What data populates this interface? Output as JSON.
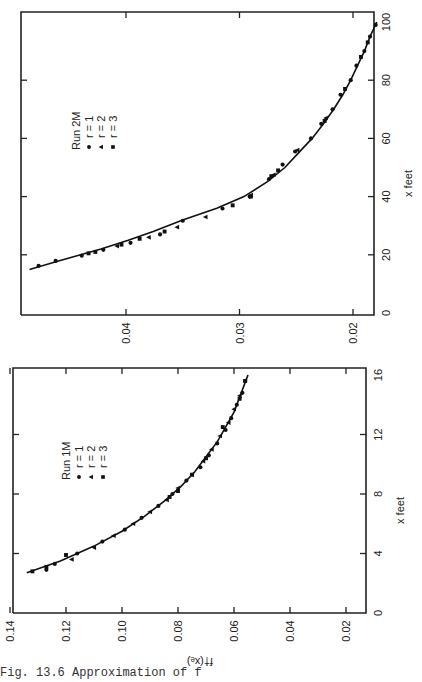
{
  "figure": {
    "caption": "Fig. 13.6  Approximation of f",
    "orientation": "rotated 90° counter-clockwise on page",
    "shared_ylabel": "f†(xₑ)",
    "marker_color": "#111111",
    "axis_color": "#222222"
  },
  "chart_data": [
    {
      "type": "scatter",
      "title": "Run 1M",
      "xlabel": "x  feet",
      "ylabel": "f†(xₑ)",
      "xlim": [
        0,
        16
      ],
      "ylim": [
        0.014,
        0.14
      ],
      "xticks": [
        0,
        4,
        8,
        12,
        16
      ],
      "xtick_labels": [
        "0",
        "4",
        "8",
        "12",
        "16"
      ],
      "yticks": [
        0.02,
        0.04,
        0.06,
        0.08,
        0.1,
        0.12,
        0.14
      ],
      "ytick_labels": [
        "0.02",
        "0.04",
        "0.06",
        "0.08",
        "0.10",
        "0.12",
        "0.14"
      ],
      "grid": false,
      "legend": {
        "title": "Run 1M",
        "entries": [
          {
            "label": "r = 1",
            "marker": "circle"
          },
          {
            "label": "r = 2",
            "marker": "triangle"
          },
          {
            "label": "r = 3",
            "marker": "square"
          }
        ],
        "position": "upper-left (in rotated frame)"
      },
      "curve": {
        "name": "fitted curve",
        "x": [
          2.7,
          3.5,
          4.5,
          5.5,
          6.5,
          7.5,
          8.5,
          9.5,
          10.5,
          11.5,
          12.5,
          13.5,
          14.5,
          15.5,
          16.0
        ],
        "y": [
          0.134,
          0.122,
          0.11,
          0.1,
          0.092,
          0.085,
          0.079,
          0.074,
          0.07,
          0.066,
          0.063,
          0.06,
          0.058,
          0.056,
          0.055
        ]
      },
      "series": [
        {
          "name": "r = 1",
          "marker": "circle",
          "x": [
            2.9,
            3.3,
            4.0,
            4.8,
            5.6,
            6.4,
            7.2,
            8.0,
            8.9,
            9.8,
            10.6,
            11.4,
            12.3,
            13.1,
            14.0,
            14.8,
            15.6
          ],
          "y": [
            0.127,
            0.124,
            0.116,
            0.107,
            0.099,
            0.093,
            0.087,
            0.082,
            0.077,
            0.072,
            0.069,
            0.066,
            0.063,
            0.061,
            0.059,
            0.057,
            0.056
          ]
        },
        {
          "name": "r = 2",
          "marker": "triangle",
          "x": [
            3.6,
            4.4,
            5.2,
            6.0,
            6.8,
            7.6,
            8.4,
            9.3,
            10.2,
            11.0,
            11.9,
            12.8,
            13.7,
            14.6
          ],
          "y": [
            0.118,
            0.11,
            0.103,
            0.096,
            0.09,
            0.084,
            0.08,
            0.075,
            0.071,
            0.068,
            0.065,
            0.062,
            0.06,
            0.058
          ]
        },
        {
          "name": "r = 3",
          "marker": "square",
          "x": [
            2.8,
            3.1,
            3.9,
            7.8,
            8.2,
            9.3,
            10.4,
            12.5,
            14.4,
            15.6
          ],
          "y": [
            0.132,
            0.127,
            0.12,
            0.083,
            0.08,
            0.075,
            0.07,
            0.064,
            0.058,
            0.056
          ]
        }
      ]
    },
    {
      "type": "scatter",
      "title": "Run 2M",
      "xlabel": "x  feet",
      "ylabel": "",
      "xlim": [
        0,
        100
      ],
      "ylim": [
        0.018,
        0.0493
      ],
      "xticks": [
        0,
        20,
        40,
        60,
        80,
        100
      ],
      "xtick_labels": [
        "0",
        "20",
        "40",
        "60",
        "80",
        "100"
      ],
      "yticks": [
        0.02,
        0.03,
        0.04
      ],
      "ytick_labels": [
        "0.02",
        "0.03",
        "0.04"
      ],
      "grid": false,
      "legend": {
        "title": "Run 2M",
        "entries": [
          {
            "label": "r = 1",
            "marker": "circle"
          },
          {
            "label": "r = 2",
            "marker": "triangle"
          },
          {
            "label": "r = 3",
            "marker": "square"
          }
        ],
        "position": "upper-left (in rotated frame)"
      },
      "curve": {
        "name": "fitted curve",
        "x": [
          15,
          18,
          20,
          22,
          25,
          28,
          32,
          36,
          40,
          45,
          50,
          55,
          60,
          65,
          70,
          75,
          80,
          85,
          90,
          95,
          100
        ],
        "y": [
          0.0485,
          0.0458,
          0.044,
          0.0422,
          0.0398,
          0.0376,
          0.035,
          0.032,
          0.0296,
          0.0276,
          0.026,
          0.0248,
          0.0236,
          0.0226,
          0.0217,
          0.0209,
          0.0202,
          0.0196,
          0.019,
          0.0185,
          0.0179
        ]
      },
      "series": [
        {
          "name": "r = 1",
          "marker": "circle",
          "x": [
            16.2,
            17.9,
            19.7,
            21.7,
            24.1,
            27.0,
            31.7,
            35.9,
            40.0,
            46.0,
            51.0,
            55.5,
            60.0,
            65.0,
            70.0,
            75.0,
            80.0,
            85.0,
            90.0,
            95.0,
            99.0
          ],
          "y": [
            0.0477,
            0.0462,
            0.0439,
            0.042,
            0.0396,
            0.037,
            0.035,
            0.0315,
            0.0291,
            0.0274,
            0.0262,
            0.0251,
            0.0237,
            0.0228,
            0.0218,
            0.0211,
            0.0202,
            0.0197,
            0.019,
            0.0185,
            0.018
          ]
        },
        {
          "name": "r = 2",
          "marker": "triangle",
          "x": [
            23.0,
            26.0,
            29.5,
            33.0,
            40.5,
            47.5,
            56.0,
            67.0
          ],
          "y": [
            0.0408,
            0.038,
            0.0355,
            0.033,
            0.029,
            0.027,
            0.0249,
            0.0224
          ]
        },
        {
          "name": "r = 3",
          "marker": "square",
          "x": [
            20.5,
            21.0,
            23.5,
            25.5,
            28.0,
            37.0,
            40.0,
            47.0,
            49.0,
            66.0,
            77.0,
            88.0,
            93.0
          ],
          "y": [
            0.0433,
            0.0427,
            0.0404,
            0.0388,
            0.0366,
            0.0306,
            0.029,
            0.0272,
            0.0266,
            0.0225,
            0.0207,
            0.0193,
            0.0187
          ]
        }
      ]
    }
  ],
  "layout_panels": [
    {
      "chart_index": 1,
      "name": "panel-run-2m",
      "corner_origin": [
        374,
        315
      ],
      "corner_top_left": [
        21,
        12
      ],
      "x_px": {
        "v0": 0,
        "p0": 313,
        "v1": 100,
        "p1": 22
      },
      "f_px": {
        "v0": 0.02,
        "p0": 353,
        "v1": 0.04,
        "p1": 126
      },
      "legend_pos": [
        80,
        150
      ]
    },
    {
      "chart_index": 0,
      "name": "panel-run-1m",
      "corner_origin": [
        366,
        613
      ],
      "corner_top_left": [
        13,
        368
      ],
      "x_px": {
        "v0": 0,
        "p0": 613,
        "v1": 16,
        "p1": 375
      },
      "f_px": {
        "v0": 0.02,
        "p0": 346,
        "v1": 0.14,
        "p1": 10
      },
      "legend_pos": [
        70,
        480
      ]
    }
  ]
}
